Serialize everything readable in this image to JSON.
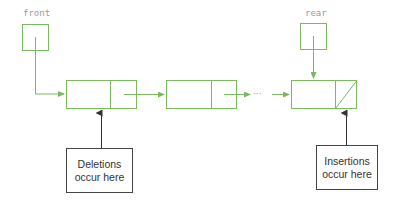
{
  "diagram": {
    "type": "linked-list-queue",
    "colors": {
      "node_stroke": "#7cb860",
      "callout_stroke": "#444444",
      "label_text": "#9a9a9a",
      "callout_text": "#333333"
    },
    "pointers": {
      "front": {
        "label": "front"
      },
      "rear": {
        "label": "rear"
      }
    },
    "nodes": [
      {
        "id": "node-1",
        "next": "node-2",
        "is_last": false
      },
      {
        "id": "node-2",
        "next": "ellipsis",
        "is_last": false
      },
      {
        "id": "node-3",
        "next": null,
        "is_last": true
      }
    ],
    "ellipsis": "···",
    "callouts": {
      "deletions": {
        "line1": "Deletions",
        "line2": "occur here",
        "points_to": "node-1"
      },
      "insertions": {
        "line1": "Insertions",
        "line2": "occur here",
        "points_to": "node-3"
      }
    }
  }
}
